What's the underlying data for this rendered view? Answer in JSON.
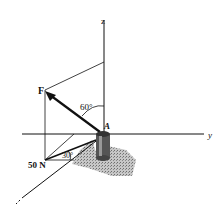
{
  "diagram": {
    "type": "3d-force-vector",
    "axes": {
      "z": "z",
      "y": "y",
      "x": "x"
    },
    "labels": {
      "force": "F",
      "point": "A",
      "magnitude": "50 N",
      "angle_vertical": "60°",
      "angle_horizontal": "30°"
    },
    "colors": {
      "line": "#111111",
      "shadow": "#8a8a8a",
      "background": "#ffffff"
    }
  }
}
